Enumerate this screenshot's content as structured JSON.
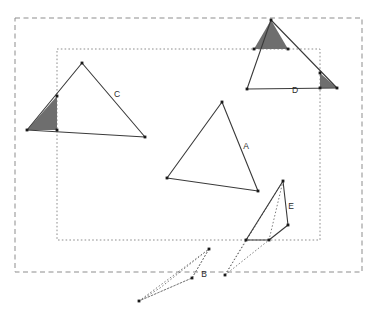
{
  "diagram": {
    "background_color": "#ffffff",
    "stroke_color": "#3a3a3a",
    "shade_color": "#6e6e6e",
    "vertex_color": "#1a1a1a",
    "label_color": "#2a2a2a",
    "clip_windows": [
      {
        "name": "outer-clip-window",
        "style": "dashed",
        "x": 15,
        "y": 18,
        "width": 347,
        "height": 254
      },
      {
        "name": "inner-clip-window",
        "style": "dotted",
        "x": 57,
        "y": 49,
        "width": 263,
        "height": 191
      }
    ],
    "shapes": [
      {
        "id": "A",
        "label": "A",
        "label_x": 246,
        "label_y": 149,
        "label_rotation": 0,
        "style": "solid",
        "points": "222,102 258,191 167,178",
        "shaded_parts": []
      },
      {
        "id": "C",
        "label": "C",
        "label_x": 117,
        "label_y": 97,
        "label_rotation": 0,
        "style": "solid",
        "points": "82,63 145,137 27,130",
        "shaded_parts": [
          "27,130 57,96 57,130"
        ]
      },
      {
        "id": "D",
        "label": "D",
        "label_x": 295,
        "label_y": 93,
        "label_rotation": 0,
        "style": "solid",
        "points": "271,20 337,88 247,89",
        "shaded_parts": [
          "271,20 288,49 254,49",
          "320,73 337,88 320,88"
        ]
      },
      {
        "id": "E",
        "label": "E",
        "label_x": 291,
        "label_y": 209,
        "label_rotation": 0,
        "style": "solid",
        "points": "283,181 288,225 269,240 246,240",
        "shaded_parts": [],
        "interior_dotted_edges": [
          "283,181 269,240"
        ]
      },
      {
        "id": "B",
        "label": "B",
        "label_x": 204,
        "label_y": 277,
        "label_rotation": 0,
        "style": "dotted",
        "points": "209,249 192,278 139,301 160,288",
        "shaded_parts": []
      }
    ],
    "dotted_connectors": [
      "139,301 209,249",
      "139,301 192,278",
      "192,278 209,249",
      "225,275 246,240",
      "225,275 269,240",
      "225,275 283,181"
    ],
    "vertices": [
      {
        "x": 222,
        "y": 102
      },
      {
        "x": 258,
        "y": 191
      },
      {
        "x": 167,
        "y": 178
      },
      {
        "x": 82,
        "y": 63
      },
      {
        "x": 145,
        "y": 137
      },
      {
        "x": 27,
        "y": 130
      },
      {
        "x": 57,
        "y": 96
      },
      {
        "x": 57,
        "y": 130
      },
      {
        "x": 271,
        "y": 20
      },
      {
        "x": 337,
        "y": 88
      },
      {
        "x": 247,
        "y": 89
      },
      {
        "x": 288,
        "y": 49
      },
      {
        "x": 254,
        "y": 49
      },
      {
        "x": 320,
        "y": 73
      },
      {
        "x": 320,
        "y": 88
      },
      {
        "x": 283,
        "y": 181
      },
      {
        "x": 288,
        "y": 225
      },
      {
        "x": 269,
        "y": 240
      },
      {
        "x": 246,
        "y": 240
      },
      {
        "x": 209,
        "y": 249
      },
      {
        "x": 192,
        "y": 278
      },
      {
        "x": 139,
        "y": 301
      },
      {
        "x": 225,
        "y": 275
      }
    ]
  }
}
